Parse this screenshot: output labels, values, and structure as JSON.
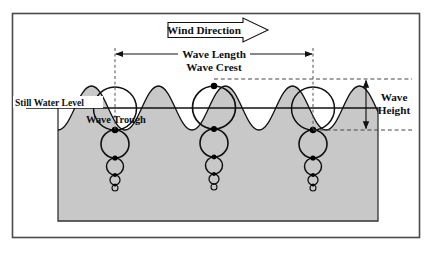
{
  "diagram": {
    "labels": {
      "wind_direction": "Wind Direction",
      "wave_length": "Wave Length",
      "wave_crest": "Wave Crest",
      "wave_trough": "Wave Trough",
      "still_water_level": "Still Water Level",
      "wave_height_line1": "Wave",
      "wave_height_line2": "Height"
    },
    "colors": {
      "water_fill": "#c8c8c8",
      "stroke": "#111111",
      "frame": "#4a4a4a",
      "background": "#ffffff",
      "dot_fill": "#000000"
    },
    "geometry": {
      "frame": {
        "x": 12,
        "y": 13,
        "width": 408,
        "height": 225
      },
      "water_box": {
        "x": 58,
        "y": 108,
        "width": 320,
        "height": 113
      },
      "still_water_level_y": 108,
      "crest_dashed_y": 79,
      "trough_dashed_y": 130,
      "wavelength_dim_y": 54,
      "dashed_vertical_left_x": 115,
      "dashed_vertical_right_x": 313,
      "wave_length_px": 198,
      "wave_amplitude_px": 22,
      "wind_arrow": {
        "x": 168,
        "y": 20,
        "width": 100,
        "height": 20
      }
    },
    "orbital_columns": [
      {
        "name": "trough-left",
        "x": 115,
        "surface_y": 130
      },
      {
        "name": "crest-center",
        "x": 214,
        "surface_y": 86
      },
      {
        "name": "trough-right",
        "x": 313,
        "surface_y": 130
      }
    ],
    "orbit_radii": [
      21.5,
      14.0,
      8.5,
      5.0,
      3.0
    ]
  }
}
